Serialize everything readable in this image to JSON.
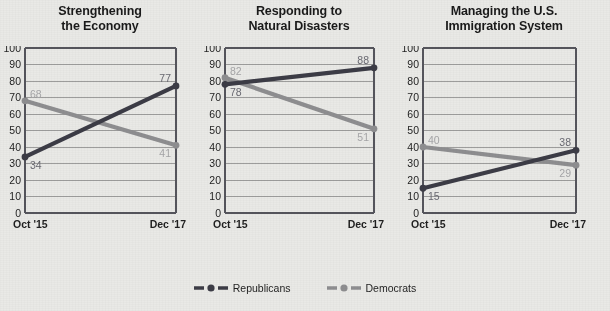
{
  "chart_data": {
    "type": "line",
    "title": "",
    "xlabel": "",
    "ylabel": "",
    "x": [
      "Oct '15",
      "Dec '17"
    ],
    "ylim": [
      0,
      100
    ],
    "yticks": [
      0,
      10,
      20,
      30,
      40,
      50,
      60,
      70,
      80,
      90,
      100
    ],
    "ytick_labels": [
      "0",
      "10",
      "20",
      "30",
      "40",
      "50",
      "60",
      "70",
      "80",
      "90",
      "100"
    ],
    "grid": true,
    "legend_position": "bottom-center",
    "legend": [
      "Republicans",
      "Democrats"
    ],
    "colors": {
      "republicans": "#3c3c46",
      "democrats": "#8e8e90",
      "background": "#e9e9e6",
      "axis": "#55555c",
      "grid": "#8a8a8a",
      "title_text": "#1a1a1a",
      "tick_text": "#1f1f1f",
      "label_republicans": "#6a6a72",
      "label_democrats": "#a6a6a8"
    },
    "panels": [
      {
        "title_line1": "Strengthening",
        "title_line2": "the Economy",
        "series": [
          {
            "name": "Republicans",
            "values": [
              34,
              77
            ],
            "labels": [
              "34",
              "77"
            ]
          },
          {
            "name": "Democrats",
            "values": [
              68,
              41
            ],
            "labels": [
              "68",
              "41"
            ]
          }
        ]
      },
      {
        "title_line1": "Responding to",
        "title_line2": "Natural Disasters",
        "series": [
          {
            "name": "Republicans",
            "values": [
              78,
              88
            ],
            "labels": [
              "78",
              "88"
            ]
          },
          {
            "name": "Democrats",
            "values": [
              82,
              51
            ],
            "labels": [
              "82",
              "51"
            ]
          }
        ]
      },
      {
        "title_line1": "Managing the U.S.",
        "title_line2": "Immigration System",
        "series": [
          {
            "name": "Republicans",
            "values": [
              15,
              38
            ],
            "labels": [
              "15",
              "38"
            ]
          },
          {
            "name": "Democrats",
            "values": [
              40,
              29
            ],
            "labels": [
              "40",
              "29"
            ]
          }
        ]
      }
    ]
  },
  "panels": [
    {
      "title_line1": "Strengthening",
      "title_line2": "the Economy",
      "x_left": "Oct '15",
      "x_right": "Dec '17"
    },
    {
      "title_line1": "Responding to",
      "title_line2": "Natural Disasters",
      "x_left": "Oct '15",
      "x_right": "Dec '17"
    },
    {
      "title_line1": "Managing the U.S.",
      "title_line2": "Immigration System",
      "x_left": "Oct '15",
      "x_right": "Dec '17"
    }
  ],
  "legend": {
    "items": [
      {
        "label": "Republicans",
        "color": "#3c3c46"
      },
      {
        "label": "Democrats",
        "color": "#8e8e90"
      }
    ]
  }
}
